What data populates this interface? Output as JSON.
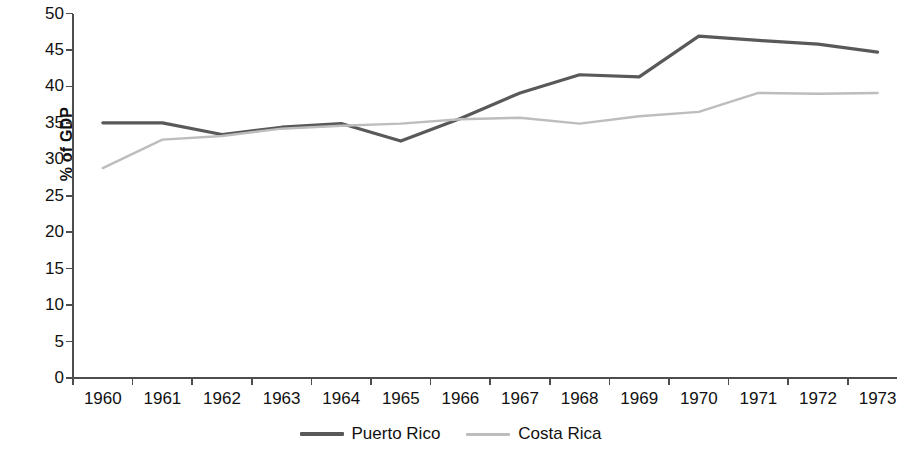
{
  "chart_data": {
    "type": "line",
    "title": "",
    "xlabel": "",
    "ylabel": "% of GDP",
    "categories": [
      "1960",
      "1961",
      "1962",
      "1963",
      "1964",
      "1965",
      "1966",
      "1967",
      "1968",
      "1969",
      "1970",
      "1971",
      "1972",
      "1973"
    ],
    "ylim": [
      0,
      50
    ],
    "ytick_step": 5,
    "yticks": [
      "50",
      "45",
      "40",
      "35",
      "30",
      "25",
      "20",
      "15",
      "10",
      "5",
      "0"
    ],
    "grid": false,
    "legend_position": "bottom-center",
    "series": [
      {
        "name": "Puerto Rico",
        "color": "#595959",
        "line_width": 3.2,
        "values": [
          35.0,
          35.0,
          33.4,
          34.4,
          34.9,
          32.5,
          35.6,
          39.1,
          41.6,
          41.3,
          46.9,
          46.3,
          45.8,
          44.7
        ]
      },
      {
        "name": "Costa Rica",
        "color": "#bdbdbd",
        "line_width": 2.4,
        "values": [
          28.8,
          32.7,
          33.2,
          34.2,
          34.6,
          34.9,
          35.5,
          35.7,
          34.9,
          35.9,
          36.5,
          39.1,
          39.0,
          39.1
        ]
      }
    ]
  },
  "axis": {
    "line_color": "#4d4d4d"
  }
}
